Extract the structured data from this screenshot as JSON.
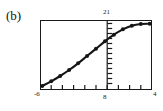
{
  "figure": {
    "panel_label": "(b)",
    "labels": {
      "y_max": "21",
      "x_min": "-6",
      "x_origin": "8",
      "x_max": "4"
    }
  },
  "chart_data": {
    "type": "line",
    "title": "(b)",
    "xlabel": "",
    "ylabel": "",
    "xlim": [
      -6,
      4
    ],
    "ylim": [
      0,
      21
    ],
    "grid": false,
    "legend": "none",
    "axis_labels": {
      "y_top": 21,
      "x_left": -6,
      "x_origin": 8,
      "x_right": 4
    },
    "annotations": [
      "vertical interior axis drawn at x = 0 with 13 right-pointing ticks",
      "bottom frame carries 9 evenly spaced upward ticks",
      "curve rises steeply then saturates near the top right"
    ],
    "series": [
      {
        "name": "data",
        "marker": "filled-circle",
        "line": "solid",
        "x": [
          -5.8,
          -5.0,
          -4.2,
          -3.4,
          -2.6,
          -1.8,
          -1.0,
          -0.2,
          0.6,
          1.4,
          2.2,
          3.0,
          3.8
        ],
        "y": [
          1.2,
          2.6,
          4.2,
          6.0,
          8.0,
          10.2,
          12.4,
          14.6,
          16.6,
          18.2,
          19.3,
          19.8,
          19.9
        ]
      }
    ]
  }
}
